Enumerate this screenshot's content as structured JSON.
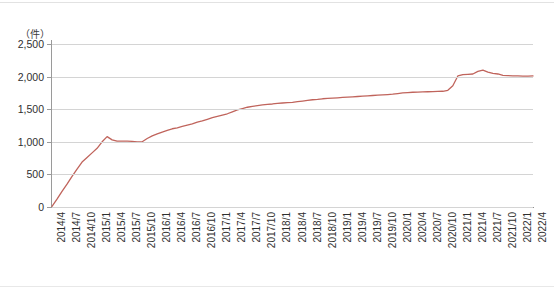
{
  "chart_data": {
    "type": "line",
    "title": "",
    "subtitle": "",
    "xlabel": "",
    "ylabel": "",
    "unit_label": "（件）",
    "ylim": [
      0,
      2500
    ],
    "ytick_values": [
      0,
      500,
      1000,
      1500,
      2000,
      2500
    ],
    "ytick_labels": [
      "0",
      "500",
      "1,000",
      "1,500",
      "2,000",
      "2,500"
    ],
    "grid": true,
    "legend": false,
    "legend_position": "none",
    "series_color": "#c0645c",
    "xtick_labels": [
      "2014/4",
      "2014/7",
      "2014/10",
      "2015/1",
      "2015/4",
      "2015/7",
      "2015/10",
      "2016/1",
      "2016/4",
      "2016/7",
      "2016/10",
      "2017/1",
      "2017/4",
      "2017/7",
      "2017/10",
      "2018/1",
      "2018/4",
      "2018/7",
      "2018/10",
      "2019/1",
      "2019/4",
      "2019/7",
      "2019/10",
      "2020/1",
      "2020/4",
      "2020/7",
      "2020/10",
      "2021/1",
      "2021/4",
      "2021/7",
      "2021/10",
      "2022/1",
      "2022/4"
    ],
    "x": [
      "2014/4",
      "2014/5",
      "2014/6",
      "2014/7",
      "2014/8",
      "2014/9",
      "2014/10",
      "2014/11",
      "2014/12",
      "2015/1",
      "2015/2",
      "2015/3",
      "2015/4",
      "2015/5",
      "2015/6",
      "2015/7",
      "2015/8",
      "2015/9",
      "2015/10",
      "2015/11",
      "2015/12",
      "2016/1",
      "2016/2",
      "2016/3",
      "2016/4",
      "2016/5",
      "2016/6",
      "2016/7",
      "2016/8",
      "2016/9",
      "2016/10",
      "2016/11",
      "2016/12",
      "2017/1",
      "2017/2",
      "2017/3",
      "2017/4",
      "2017/5",
      "2017/6",
      "2017/7",
      "2017/8",
      "2017/9",
      "2017/10",
      "2017/11",
      "2017/12",
      "2018/1",
      "2018/2",
      "2018/3",
      "2018/4",
      "2018/5",
      "2018/6",
      "2018/7",
      "2018/8",
      "2018/9",
      "2018/10",
      "2018/11",
      "2018/12",
      "2019/1",
      "2019/2",
      "2019/3",
      "2019/4",
      "2019/5",
      "2019/6",
      "2019/7",
      "2019/8",
      "2019/9",
      "2019/10",
      "2019/11",
      "2019/12",
      "2020/1",
      "2020/2",
      "2020/3",
      "2020/4",
      "2020/5",
      "2020/6",
      "2020/7",
      "2020/8",
      "2020/9",
      "2020/10",
      "2020/11",
      "2020/12",
      "2021/1",
      "2021/2",
      "2021/3",
      "2021/4",
      "2021/5",
      "2021/6",
      "2021/7",
      "2021/8",
      "2021/9",
      "2021/10",
      "2021/11",
      "2021/12",
      "2022/1",
      "2022/2",
      "2022/3",
      "2022/4"
    ],
    "values": [
      10,
      120,
      240,
      350,
      470,
      580,
      690,
      760,
      830,
      900,
      1000,
      1080,
      1030,
      1010,
      1010,
      1010,
      1005,
      1000,
      1000,
      1050,
      1090,
      1120,
      1150,
      1175,
      1200,
      1215,
      1235,
      1255,
      1275,
      1300,
      1320,
      1345,
      1370,
      1390,
      1410,
      1430,
      1460,
      1490,
      1510,
      1530,
      1545,
      1555,
      1565,
      1575,
      1580,
      1590,
      1595,
      1600,
      1605,
      1615,
      1625,
      1635,
      1645,
      1650,
      1660,
      1665,
      1670,
      1675,
      1680,
      1685,
      1690,
      1695,
      1700,
      1705,
      1710,
      1715,
      1720,
      1725,
      1730,
      1740,
      1750,
      1755,
      1760,
      1762,
      1765,
      1768,
      1770,
      1772,
      1775,
      1790,
      1860,
      2010,
      2030,
      2035,
      2040,
      2080,
      2100,
      2070,
      2050,
      2040,
      2020,
      2015,
      2012,
      2010,
      2008,
      2008,
      2010
    ]
  }
}
